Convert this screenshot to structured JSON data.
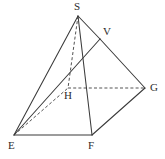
{
  "figure": {
    "name": "pyramid-geometry-figure",
    "type": "line-diagram",
    "width": 165,
    "height": 159,
    "background_color": "#ffffff",
    "line_color": "#3a3a3a",
    "dashed_line_color": "#4a4a4a",
    "label_color": "#2b2b2b",
    "vertices": [
      {
        "id": "S",
        "label": "S",
        "x": 78,
        "y": 16,
        "label_x": 74,
        "label_y": 1,
        "hidden": false
      },
      {
        "id": "V",
        "label": "V",
        "x": 100,
        "y": 39,
        "label_x": 103,
        "label_y": 26,
        "hidden": false
      },
      {
        "id": "G",
        "label": "G",
        "x": 145,
        "y": 88,
        "label_x": 150,
        "label_y": 82,
        "hidden": false
      },
      {
        "id": "H",
        "label": "H",
        "x": 68,
        "y": 88,
        "label_x": 64,
        "label_y": 90,
        "hidden": true
      },
      {
        "id": "E",
        "label": "E",
        "x": 14,
        "y": 135,
        "label_x": 8,
        "label_y": 140,
        "hidden": false
      },
      {
        "id": "F",
        "label": "F",
        "x": 92,
        "y": 135,
        "label_x": 88,
        "label_y": 140,
        "hidden": false
      }
    ],
    "edges": [
      {
        "id": "S-E",
        "from": "S",
        "to": "E",
        "style": "solid"
      },
      {
        "id": "S-V",
        "from": "S",
        "to": "V",
        "style": "solid"
      },
      {
        "id": "V-G",
        "from": "V",
        "to": "G",
        "style": "solid"
      },
      {
        "id": "S-F",
        "from": "S",
        "to": "F",
        "style": "solid"
      },
      {
        "id": "E-V",
        "from": "E",
        "to": "V",
        "style": "solid"
      },
      {
        "id": "E-F",
        "from": "E",
        "to": "F",
        "style": "solid"
      },
      {
        "id": "F-G",
        "from": "F",
        "to": "G",
        "style": "solid"
      },
      {
        "id": "S-H",
        "from": "S",
        "to": "H",
        "style": "dashed"
      },
      {
        "id": "E-H",
        "from": "E",
        "to": "H",
        "style": "dashed"
      },
      {
        "id": "H-G",
        "from": "H",
        "to": "G",
        "style": "dashed"
      }
    ]
  }
}
